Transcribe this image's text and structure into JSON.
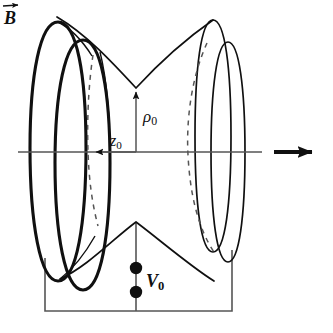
{
  "figure": {
    "background_color": "#ffffff",
    "ink_color": "#101010",
    "thin_line_color": "#555555",
    "width": 333,
    "height": 333
  },
  "labels": {
    "rho": {
      "symbol": "ρ",
      "subscript": "0",
      "name": "rho-zero",
      "meaning": "ring electrode radius"
    },
    "z": {
      "symbol": "z",
      "subscript": "0",
      "name": "z-zero",
      "meaning": "axial half-separation"
    },
    "voltage": {
      "symbol": "V",
      "subscript": "0",
      "name": "v-zero",
      "meaning": "trapping potential"
    },
    "bfield": {
      "symbol": "B",
      "subscript": "",
      "name": "b-field",
      "meaning": "magnetic field vector"
    }
  },
  "geometry": {
    "axis": {
      "y": 152,
      "x_start": 18,
      "x_end": 262
    },
    "b_arrow": {
      "x_start": 274,
      "x_end": 322,
      "y": 152
    },
    "rho_arrow": {
      "x": 136,
      "y_start": 152,
      "y_end": 86
    },
    "z_arrow": {
      "y": 152,
      "x_start": 136,
      "x_end": 90
    },
    "circuit": {
      "left_x": 45,
      "right_x": 232,
      "bottom_y": 311,
      "center_x": 136
    },
    "terminals": [
      {
        "cx": 136,
        "cy": 268,
        "r": 6
      },
      {
        "cx": 136,
        "cy": 292,
        "r": 6
      }
    ]
  },
  "elements": {
    "endcap_left": "thick-ellipse-pair",
    "ring_right": "thin-ellipse-pair",
    "hidden_edge": "dashed-arc",
    "ring_profile_top": "hyperbola-top",
    "ring_profile_bottom": "hyperbola-bottom"
  }
}
